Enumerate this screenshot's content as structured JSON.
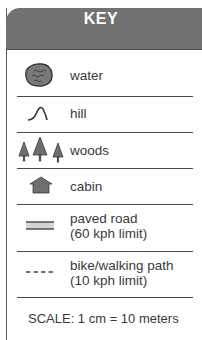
{
  "key": {
    "title": "KEY",
    "items": [
      {
        "icon": "water-icon",
        "label": "water"
      },
      {
        "icon": "hill-icon",
        "label": "hill"
      },
      {
        "icon": "woods-icon",
        "label": "woods"
      },
      {
        "icon": "cabin-icon",
        "label": "cabin"
      },
      {
        "icon": "paved-road-icon",
        "label_line1": "paved road",
        "label_line2": "(60 kph limit)"
      },
      {
        "icon": "path-icon",
        "label_line1": "bike/walking path",
        "label_line2": "(10 kph limit)"
      }
    ],
    "scale": "SCALE: 1 cm = 10 meters"
  },
  "colors": {
    "header": "#727272",
    "icon_fill": "#6e6e6e",
    "text": "#3a3a3a"
  }
}
